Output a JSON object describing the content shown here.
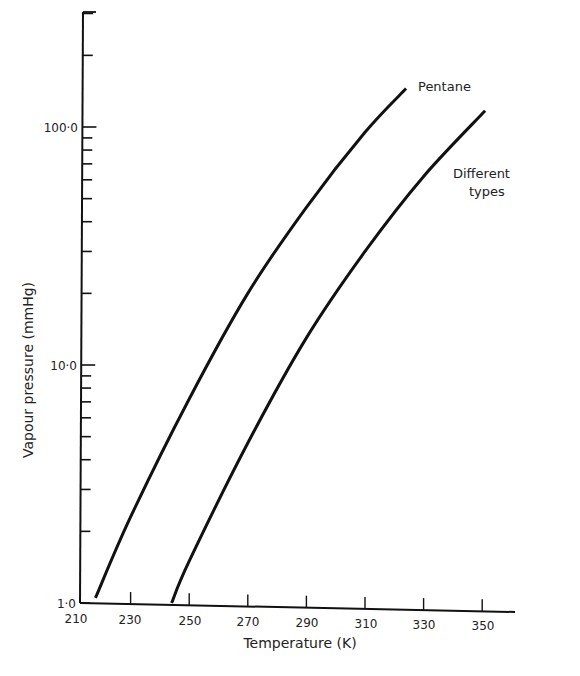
{
  "chart_data": {
    "type": "line",
    "title": "",
    "xlabel": "Temperature (K)",
    "ylabel": "Vapour pressure (mmHg)",
    "yscale": "log",
    "xlim": [
      210,
      375
    ],
    "ylim": [
      1.0,
      300.0
    ],
    "grid": false,
    "legend_position": "inline labels at curve ends (upper right)",
    "x_ticks": [
      210,
      230,
      250,
      270,
      290,
      310,
      330,
      350
    ],
    "x_tick_labels": [
      "210",
      "230",
      "250",
      "270",
      "290",
      "310",
      "330",
      "350"
    ],
    "y_ticks_labeled": [
      1.0,
      10.0,
      100.0
    ],
    "y_tick_labels": [
      "1·0",
      "10·0",
      "100·0"
    ],
    "y_minor_ticks": [
      2,
      3,
      4,
      5,
      6,
      7,
      8,
      9,
      20,
      30,
      40,
      50,
      60,
      70,
      80,
      90,
      200,
      300
    ],
    "series": [
      {
        "name": "Pentane",
        "label": "Pentane",
        "x": [
          218,
          230,
          250,
          270,
          290,
          310,
          324
        ],
        "y": [
          1.05,
          2.3,
          7.2,
          20,
          46,
          95,
          145
        ]
      },
      {
        "name": "Different types",
        "label": "Different\ntypes",
        "x": [
          244,
          250,
          270,
          290,
          310,
          330,
          351
        ],
        "y": [
          1.0,
          1.5,
          4.7,
          13,
          30,
          62,
          117
        ]
      }
    ],
    "annotations": [
      {
        "text": "Pentane",
        "at": [
          324,
          145
        ]
      },
      {
        "text": "Different types",
        "at": [
          351,
          60
        ]
      }
    ]
  },
  "axes": {
    "xlabel": "Temperature (K)",
    "ylabel": "Vapour pressure (mmHg)",
    "x_tick_labels": [
      "210",
      "230",
      "250",
      "270",
      "290",
      "310",
      "330",
      "350"
    ],
    "y_tick_labels": {
      "one": "1·0",
      "ten": "10·0",
      "hundred": "100·0"
    }
  },
  "labels": {
    "pentane": "Pentane",
    "different_line1": "Different",
    "different_line2": "types"
  }
}
